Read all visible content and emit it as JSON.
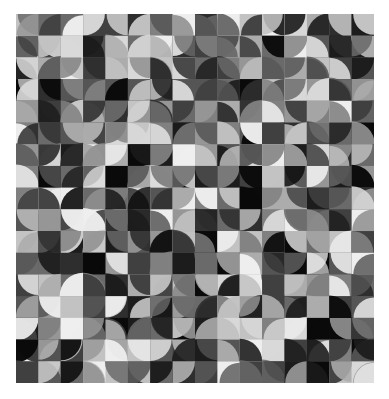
{
  "artwork": {
    "description": "Grayscale generative mosaic of quarter-circle tiles",
    "left": 16,
    "top": 14,
    "width": 358,
    "height": 369,
    "columns": 16,
    "rows": 17,
    "seed": 1337,
    "palette": [
      "#0a0a0a",
      "#1c1c1c",
      "#2e2e2e",
      "#404040",
      "#555555",
      "#6a6a6a",
      "#808080",
      "#969696",
      "#acacac",
      "#c2c2c2",
      "#d8d8d8",
      "#eeeeee"
    ]
  }
}
